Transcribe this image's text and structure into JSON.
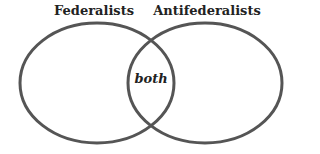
{
  "diagram": {
    "type": "venn",
    "sets": [
      {
        "label": "Federalists",
        "cx": 97,
        "cy": 83,
        "rx": 77,
        "ry": 60
      },
      {
        "label": "Antifederalists",
        "cx": 205,
        "cy": 83,
        "rx": 77,
        "ry": 60
      }
    ],
    "intersection_label": "both",
    "stroke_color": "#555555",
    "stroke_width": 3
  }
}
